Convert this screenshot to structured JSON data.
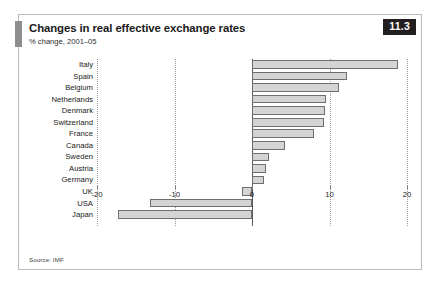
{
  "figure": {
    "badge": "11.3",
    "title": "Changes in real effective exchange rates",
    "subtitle": "% change, 2001–05",
    "source": "Source: IMF",
    "accent_color": "#231f20",
    "bar_fill": "#d4d4d4",
    "bar_stroke": "#6e6e6e",
    "grid_color": "#9a9a9a",
    "frame_color": "#b9b9b9"
  },
  "chart_data": {
    "type": "bar",
    "orientation": "horizontal",
    "title": "Changes in real effective exchange rates",
    "subtitle": "% change, 2001–05",
    "xlabel": "",
    "ylabel": "",
    "xlim": [
      -20,
      20
    ],
    "xticks": [
      -20,
      -10,
      0,
      10,
      20
    ],
    "xticklabels": [
      "-20",
      "-10",
      "0",
      "10",
      "20"
    ],
    "grid": true,
    "grid_axis": "x",
    "legend": false,
    "source": "Source: IMF",
    "categories": [
      "Italy",
      "Spain",
      "Belgium",
      "Netherlands",
      "Denmark",
      "Switzerland",
      "France",
      "Canada",
      "Sweden",
      "Austria",
      "Germany",
      "UK",
      "USA",
      "Japan"
    ],
    "values": [
      18.9,
      12.3,
      11.2,
      9.6,
      9.4,
      9.3,
      8.0,
      4.3,
      2.2,
      1.8,
      1.5,
      -1.3,
      -13.2,
      -17.3
    ]
  }
}
